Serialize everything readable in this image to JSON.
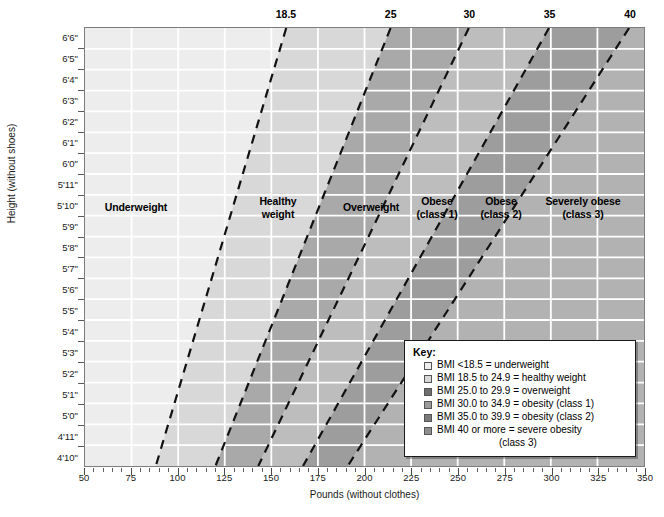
{
  "chart_data": {
    "type": "area",
    "title": "",
    "subtitle": "",
    "xlabel": "Pounds (without clothes)",
    "ylabel": "Height (without shoes)",
    "xlim": [
      50,
      350
    ],
    "xticks": [
      50,
      75,
      100,
      125,
      150,
      175,
      200,
      225,
      250,
      275,
      300,
      325,
      350
    ],
    "xtick_minor_step": 5,
    "ylim_labels": [
      "4'10\"",
      "6'6\""
    ],
    "yticks": [
      "6'6\"",
      "6'5\"",
      "6'4\"",
      "6'3\"",
      "6'2\"",
      "6'1\"",
      "6'0\"",
      "5'11\"",
      "5'10\"",
      "5'9\"",
      "5'8\"",
      "5'7\"",
      "5'6\"",
      "5'5\"",
      "5'4\"",
      "5'3\"",
      "5'2\"",
      "5'1\"",
      "5'0\"",
      "4'11\"",
      "4'10\""
    ],
    "ytick_inches": [
      78,
      77,
      76,
      75,
      74,
      73,
      72,
      71,
      70,
      69,
      68,
      67,
      66,
      65,
      64,
      63,
      62,
      61,
      60,
      59,
      58
    ],
    "grid": true,
    "legend_position": "inside-bottom-right",
    "top_axis_label": "BMI",
    "bmi_boundaries": [
      {
        "bmi": "18.5",
        "value": 18.5,
        "top_lbs": 158,
        "bottom_lbs": 88
      },
      {
        "bmi": "25",
        "value": 25,
        "top_lbs": 214,
        "bottom_lbs": 120
      },
      {
        "bmi": "30",
        "value": 30,
        "top_lbs": 256,
        "bottom_lbs": 143
      },
      {
        "bmi": "35",
        "value": 35,
        "top_lbs": 299,
        "bottom_lbs": 167
      },
      {
        "bmi": "40",
        "value": 40,
        "top_lbs": 342,
        "bottom_lbs": 191
      }
    ],
    "bands": [
      {
        "name": "Underweight",
        "bmi_min": 0,
        "bmi_max": 18.5,
        "color": "#ededed",
        "label": "Underweight"
      },
      {
        "name": "Healthy weight",
        "bmi_min": 18.5,
        "bmi_max": 25,
        "color": "#d8d8d8",
        "label": "Healthy\nweight"
      },
      {
        "name": "Overweight",
        "bmi_min": 25,
        "bmi_max": 30,
        "color": "#a9a9a9",
        "label": "Overweight"
      },
      {
        "name": "Obese (class 1)",
        "bmi_min": 30,
        "bmi_max": 35,
        "color": "#bdbdbd",
        "label": "Obese\n(class 1)"
      },
      {
        "name": "Obese (class 2)",
        "bmi_min": 35,
        "bmi_max": 40,
        "color": "#9d9d9d",
        "label": "Obese\n(class 2)"
      },
      {
        "name": "Severely obese (class 3)",
        "bmi_min": 40,
        "bmi_max": 999,
        "color": "#b2b2b2",
        "label": "Severely obese\n(class 3)"
      }
    ]
  },
  "axes": {
    "x_title": "Pounds (without clothes)",
    "y_title": "Height (without shoes)",
    "x_ticks": [
      "50",
      "75",
      "100",
      "125",
      "150",
      "175",
      "200",
      "225",
      "250",
      "275",
      "300",
      "325",
      "350"
    ],
    "y_ticks": [
      "6'6\"",
      "6'5\"",
      "6'4\"",
      "6'3\"",
      "6'2\"",
      "6'1\"",
      "6'0\"",
      "5'11\"",
      "5'10\"",
      "5'9\"",
      "5'8\"",
      "5'7\"",
      "5'6\"",
      "5'5\"",
      "5'4\"",
      "5'3\"",
      "5'2\"",
      "5'1\"",
      "5'0\"",
      "4'11\"",
      "4'10\""
    ],
    "top_bmi_ticks": [
      "18.5",
      "25",
      "30",
      "35",
      "40"
    ]
  },
  "regions": [
    {
      "label": "Underweight",
      "line1": "Underweight",
      "line2": ""
    },
    {
      "label": "Healthy weight",
      "line1": "Healthy",
      "line2": "weight"
    },
    {
      "label": "Overweight",
      "line1": "Overweight",
      "line2": ""
    },
    {
      "label": "Obese (class 1)",
      "line1": "Obese",
      "line2": "(class 1)"
    },
    {
      "label": "Obese (class 2)",
      "line1": "Obese",
      "line2": "(class 2)"
    },
    {
      "label": "Severely obese (class 3)",
      "line1": "Severely obese",
      "line2": "(class 3)"
    }
  ],
  "key": {
    "title": "Key:",
    "items": [
      {
        "swatch": "#ededed",
        "text": "BMI <18.5 = underweight",
        "cont": ""
      },
      {
        "swatch": "#d8d8d8",
        "text": "BMI 18.5 to 24.9 = healthy weight",
        "cont": ""
      },
      {
        "swatch": "#6e6e6e",
        "text": "BMI 25.0 to 29.9 = overweight",
        "cont": ""
      },
      {
        "swatch": "#9a9a9a",
        "text": "BMI 30.0 to 34.9 = obesity (class 1)",
        "cont": ""
      },
      {
        "swatch": "#7a7a7a",
        "text": "BMI 35.0 to 39.9 = obesity (class 2)",
        "cont": ""
      },
      {
        "swatch": "#8d8d8d",
        "text": "BMI 40 or more = severe obesity",
        "cont": "(class 3)"
      }
    ]
  },
  "colors": {
    "underweight": "#ededed",
    "healthy": "#d8d8d8",
    "overweight": "#a9a9a9",
    "obese1": "#bdbdbd",
    "obese2": "#9d9d9d",
    "obese3": "#b2b2b2",
    "grid": "#ffffff",
    "frame": "#7d7d7d",
    "boundary_line": "#111111"
  }
}
